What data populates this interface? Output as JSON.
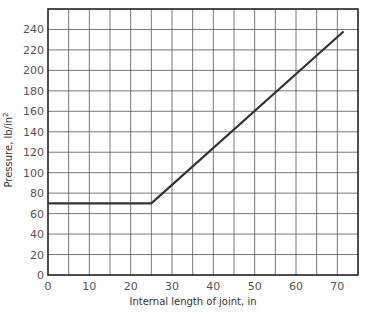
{
  "chart_data": {
    "type": "line",
    "title": "",
    "xlabel": "Internal length of joint, in",
    "ylabel": "Pressure, lb/in",
    "ylabel_superscript": "2",
    "xlim": [
      0,
      75
    ],
    "ylim": [
      0,
      260
    ],
    "x_ticks": [
      0,
      10,
      20,
      30,
      40,
      50,
      60,
      70
    ],
    "y_ticks": [
      0,
      20,
      40,
      60,
      80,
      100,
      120,
      140,
      160,
      180,
      200,
      220,
      240
    ],
    "x_grid_step": 5,
    "y_grid_step": 20,
    "grid": true,
    "legend": "none",
    "series": [
      {
        "name": "Pressure",
        "x": [
          0,
          25,
          71.5
        ],
        "y": [
          70,
          70,
          238
        ]
      }
    ]
  }
}
